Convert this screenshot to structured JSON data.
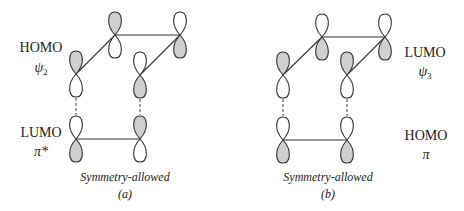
{
  "colors": {
    "shaded": "#cfcfcf",
    "unshaded": "#ffffff",
    "outline": "#333333"
  },
  "panels": [
    {
      "id": "a",
      "top_label": {
        "name": "HOMO",
        "symbol": "ψ",
        "subscript": "2",
        "x": 41,
        "y": 52,
        "sym_y": 72
      },
      "bottom_label": {
        "name": "LUMO",
        "symbol": "π*",
        "subscript": "",
        "x": 41,
        "y": 137,
        "sym_y": 156
      },
      "caption": "Symmetry-allowed",
      "letter": "(a)",
      "caption_x": 125,
      "top_atoms": [
        {
          "x": 76,
          "y": 74,
          "upper": "shaded",
          "lower": "unshaded"
        },
        {
          "x": 115,
          "y": 35,
          "upper": "shaded",
          "lower": "unshaded"
        },
        {
          "x": 180,
          "y": 35,
          "upper": "unshaded",
          "lower": "shaded"
        },
        {
          "x": 140,
          "y": 75,
          "upper": "unshaded",
          "lower": "shaded"
        }
      ],
      "bottom_atoms": [
        {
          "x": 76,
          "y": 139,
          "upper": "unshaded",
          "lower": "shaded"
        },
        {
          "x": 140,
          "y": 139,
          "upper": "shaded",
          "lower": "unshaded"
        }
      ]
    },
    {
      "id": "b",
      "top_label": {
        "name": "LUMO",
        "symbol": "ψ",
        "subscript": "3",
        "x": 425,
        "y": 57,
        "sym_y": 76
      },
      "bottom_label": {
        "name": "HOMO",
        "symbol": "π",
        "subscript": "",
        "x": 426,
        "y": 140,
        "sym_y": 159
      },
      "caption": "Symmetry-allowed",
      "letter": "(b)",
      "caption_x": 328,
      "top_atoms": [
        {
          "x": 283,
          "y": 75,
          "upper": "shaded",
          "lower": "unshaded"
        },
        {
          "x": 322,
          "y": 37,
          "upper": "unshaded",
          "lower": "shaded"
        },
        {
          "x": 385,
          "y": 37,
          "upper": "unshaded",
          "lower": "shaded"
        },
        {
          "x": 347,
          "y": 75,
          "upper": "shaded",
          "lower": "unshaded"
        }
      ],
      "bottom_atoms": [
        {
          "x": 283,
          "y": 140,
          "upper": "unshaded",
          "lower": "shaded"
        },
        {
          "x": 347,
          "y": 140,
          "upper": "unshaded",
          "lower": "shaded"
        }
      ]
    }
  ]
}
